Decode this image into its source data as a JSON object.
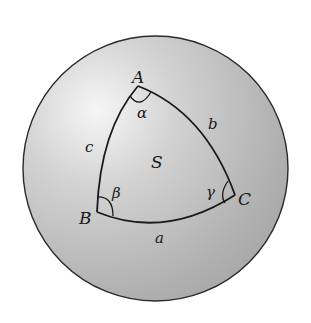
{
  "diagram": {
    "type": "spherical-triangle",
    "sphere": {
      "fill_light": "#f4f4f4",
      "fill_dark": "#a8a8a8",
      "stroke": "#2a2a2a"
    },
    "vertices": [
      {
        "id": "A",
        "label": "A",
        "angle_label": "α"
      },
      {
        "id": "B",
        "label": "B",
        "angle_label": "β"
      },
      {
        "id": "C",
        "label": "C",
        "angle_label": "γ"
      }
    ],
    "sides": [
      {
        "id": "a",
        "label": "a",
        "between": "B-C"
      },
      {
        "id": "b",
        "label": "b",
        "between": "A-C"
      },
      {
        "id": "c",
        "label": "c",
        "between": "A-B"
      }
    ],
    "area_label": "S"
  }
}
